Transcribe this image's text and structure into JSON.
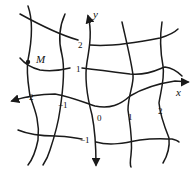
{
  "diagram": {
    "title": "",
    "axes": {
      "x_label": "x",
      "y_label": "y"
    },
    "point": {
      "label": "M"
    },
    "y_ticks": [
      "2",
      "1",
      "0",
      "-1"
    ],
    "x_ticks": [
      "-2",
      "-1",
      "1",
      "2"
    ],
    "labels": {
      "origin": "0",
      "y2": "2",
      "y1": "1",
      "ym1": "−1",
      "xm2": "−2",
      "xm1": "−1",
      "x1": "1",
      "x2": "2"
    },
    "colors": {
      "stroke": "#1a1a1a",
      "background": "#ffffff"
    }
  }
}
